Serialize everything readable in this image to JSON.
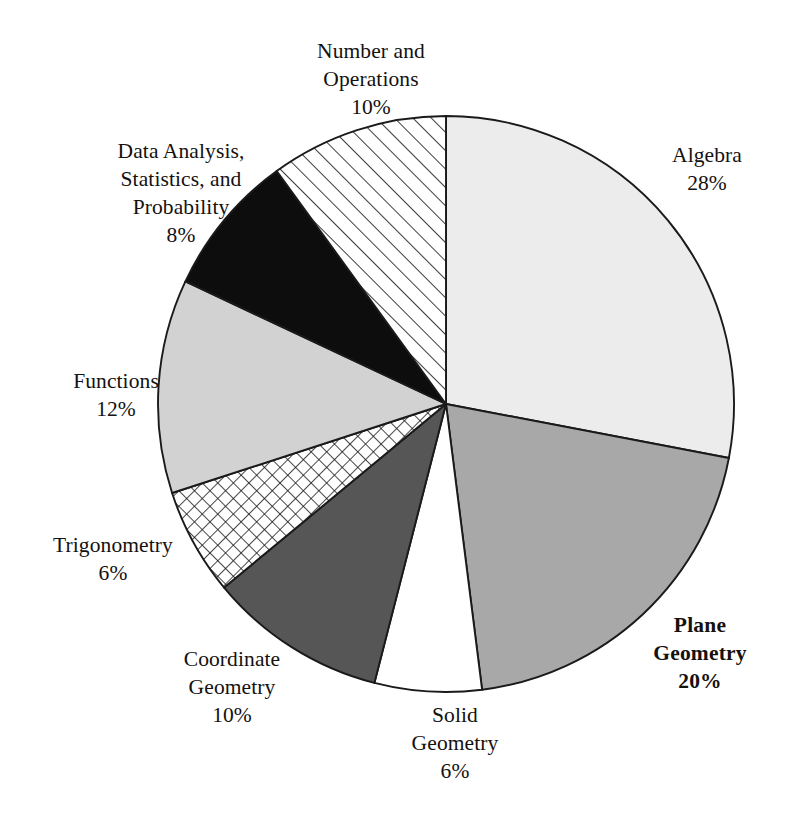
{
  "chart_data": {
    "type": "pie",
    "title": "",
    "subtitle": "",
    "xlabel": "",
    "ylabel": "",
    "legend_position": "none",
    "grid": false,
    "units": "percent",
    "start_angle_deg": 0,
    "direction": "clockwise",
    "total": 100,
    "categories": [
      "Algebra",
      "Plane Geometry",
      "Solid Geometry",
      "Coordinate Geometry",
      "Trigonometry",
      "Functions",
      "Data Analysis, Statistics, and Probability",
      "Number and Operations"
    ],
    "values": [
      28,
      20,
      6,
      10,
      6,
      12,
      8,
      10
    ],
    "slices": [
      {
        "name": "algebra",
        "label": "Algebra",
        "value": 28,
        "value_text": "28%",
        "fill": "#ececec",
        "pattern": "solid",
        "emphasis": "normal"
      },
      {
        "name": "plane-geometry",
        "label": "Plane\nGeometry",
        "value": 20,
        "value_text": "20%",
        "fill": "#a8a8a8",
        "pattern": "solid",
        "emphasis": "bold"
      },
      {
        "name": "solid-geometry",
        "label": "Solid\nGeometry",
        "value": 6,
        "value_text": "6%",
        "fill": "#ffffff",
        "pattern": "solid",
        "emphasis": "normal"
      },
      {
        "name": "coordinate-geometry",
        "label": "Coordinate\nGeometry",
        "value": 10,
        "value_text": "10%",
        "fill": "#565656",
        "pattern": "solid",
        "emphasis": "normal"
      },
      {
        "name": "trigonometry",
        "label": "Trigonometry",
        "value": 6,
        "value_text": "6%",
        "fill": "#ffffff",
        "pattern": "cross-hatch",
        "emphasis": "normal"
      },
      {
        "name": "functions",
        "label": "Functions",
        "value": 12,
        "value_text": "12%",
        "fill": "#d2d2d2",
        "pattern": "solid",
        "emphasis": "normal"
      },
      {
        "name": "data-analysis",
        "label": "Data Analysis,\nStatistics, and\nProbability",
        "value": 8,
        "value_text": "8%",
        "fill": "#0d0d0d",
        "pattern": "solid",
        "emphasis": "normal"
      },
      {
        "name": "number-and-operations",
        "label": "Number and\nOperations",
        "value": 10,
        "value_text": "10%",
        "fill": "#ffffff",
        "pattern": "diagonal-hatch",
        "emphasis": "normal"
      }
    ]
  },
  "labels": {
    "number_operations": "Number and\nOperations\n10%",
    "data_analysis": "Data Analysis,\nStatistics, and\nProbability\n8%",
    "functions": "Functions\n12%",
    "trigonometry": "Trigonometry\n6%",
    "coordinate_geometry": "Coordinate\nGeometry\n10%",
    "solid_geometry": "Solid\nGeometry\n6%",
    "plane_geometry": "Plane\nGeometry\n20%",
    "algebra": "Algebra\n28%"
  },
  "colors": {
    "background": "#ffffff",
    "outline": "#1a1a1a",
    "text": "#14110f"
  }
}
